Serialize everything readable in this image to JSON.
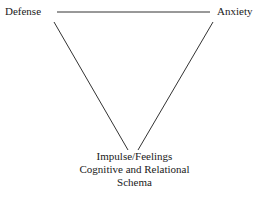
{
  "diagram": {
    "type": "triangle",
    "nodes": {
      "top_left": "Defense",
      "top_right": "Anxiety",
      "bottom": [
        "Impulse/Feelings",
        "Cognitive and Relational",
        "Schema"
      ]
    },
    "edges": [
      {
        "from": "Defense",
        "to": "Anxiety"
      },
      {
        "from": "Defense",
        "to": "Impulse/Feelings"
      },
      {
        "from": "Anxiety",
        "to": "Impulse/Feelings"
      }
    ],
    "line_color": "#333333"
  }
}
